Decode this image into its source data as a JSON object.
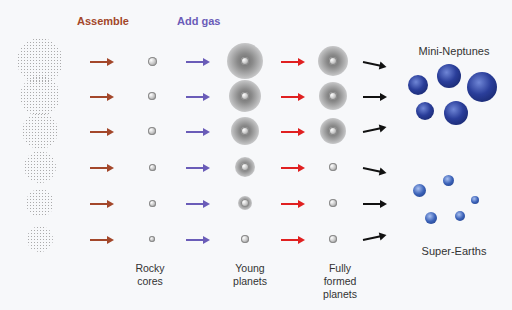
{
  "headers": {
    "assemble": "Assemble",
    "add_gas": "Add gas"
  },
  "colors": {
    "assemble": "#a3472a",
    "add_gas": "#6a5cb8",
    "red_arrow": "#e02020",
    "black_arrow": "#111111"
  },
  "column_labels": {
    "rocky_cores": "Rocky\ncores",
    "young_planets": "Young\nplanets",
    "fully_formed": "Fully\nformed\nplanets"
  },
  "outcomes": {
    "mini_neptunes": "Mini-Neptunes",
    "super_earths": "Super-Earths"
  },
  "rows": [
    {
      "cloud": 46,
      "core": 9,
      "halo": 36,
      "final_halo": 30
    },
    {
      "cloud": 40,
      "core": 8,
      "halo": 32,
      "final_halo": 28
    },
    {
      "cloud": 36,
      "core": 8,
      "halo": 28,
      "final_halo": 26
    },
    {
      "cloud": 32,
      "core": 7,
      "halo": 20,
      "final_halo": 0
    },
    {
      "cloud": 28,
      "core": 7,
      "halo": 14,
      "final_halo": 0
    },
    {
      "cloud": 26,
      "core": 6,
      "halo": 0,
      "final_halo": 0
    }
  ]
}
